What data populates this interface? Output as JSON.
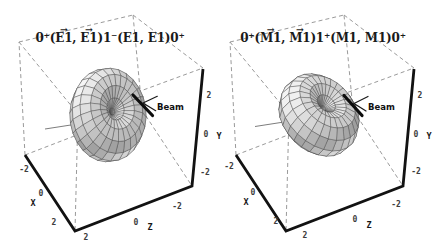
{
  "figure": {
    "vec_arrow": "→",
    "plots": [
      {
        "id": "left",
        "title_parts": {
          "p1": "0⁺(",
          "v1": "E1",
          "sep": ", ",
          "v2": "E1",
          "p2": ")1⁻(E1, E1)0⁺"
        },
        "beam_label": "Beam",
        "axes": {
          "x": {
            "label": "X",
            "ticks": [
              "-2",
              "0",
              "2"
            ]
          },
          "y": {
            "label": "Y",
            "ticks": [
              "2",
              "0",
              "-2"
            ]
          },
          "z": {
            "label": "Z",
            "ticks": [
              "2",
              "0",
              "-2"
            ]
          }
        }
      },
      {
        "id": "right",
        "title_parts": {
          "p1": "0⁺(",
          "v1": "M1",
          "sep": ", ",
          "v2": "M1",
          "p2": ")1⁺(M1, M1)0⁺"
        },
        "beam_label": "Beam",
        "axes": {
          "x": {
            "label": "X",
            "ticks": [
              "-2",
              "0",
              "2"
            ]
          },
          "y": {
            "label": "Y",
            "ticks": [
              "2",
              "0",
              "-2"
            ]
          },
          "z": {
            "label": "Z",
            "ticks": [
              "2",
              "0",
              "-2"
            ]
          }
        }
      }
    ]
  },
  "chart_data": [
    {
      "type": "surface",
      "title": "0⁺(E⃗1, E⃗1)1⁻(E1, E1)0⁺",
      "xlabel": "X",
      "ylabel": "Y",
      "zlabel": "Z",
      "xlim": [
        -2,
        2
      ],
      "ylim": [
        -2,
        2
      ],
      "zlim": [
        -2,
        2
      ],
      "xticks": [
        -2,
        0,
        2
      ],
      "yticks": [
        -2,
        0,
        2
      ],
      "zticks": [
        -2,
        0,
        2
      ],
      "grid": "dashed bounding box",
      "annotation": "Beam",
      "surface": {
        "kind": "two-photon angular correlation, dipole torus W(θ) ∝ sin²θ",
        "amplitude": 1.35,
        "symmetry_axis": [
          0.583,
          0.758,
          -0.292
        ],
        "theta_steps": 14,
        "phi_steps": 26,
        "fill_color": "#bcbcbc",
        "line_color": "#3f3f3f"
      }
    },
    {
      "type": "surface",
      "title": "0⁺(M⃗1, M⃗1)1⁺(M1, M1)0⁺",
      "xlabel": "X",
      "ylabel": "Y",
      "zlabel": "Z",
      "xlim": [
        -2,
        2
      ],
      "ylim": [
        -2,
        2
      ],
      "zlim": [
        -2,
        2
      ],
      "xticks": [
        -2,
        0,
        2
      ],
      "yticks": [
        -2,
        0,
        2
      ],
      "zticks": [
        -2,
        0,
        2
      ],
      "grid": "dashed bounding box",
      "annotation": "Beam",
      "surface": {
        "kind": "two-photon angular correlation, dipole torus W(θ) ∝ sin²θ",
        "amplitude": 1.4,
        "symmetry_axis": [
          0.222,
          0.889,
          -0.4
        ],
        "theta_steps": 14,
        "phi_steps": 26,
        "fill_color": "#bcbcbc",
        "line_color": "#3f3f3f"
      }
    }
  ]
}
